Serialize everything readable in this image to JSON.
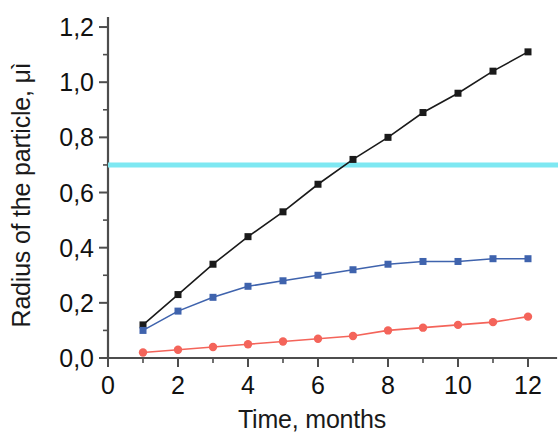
{
  "chart_data": {
    "type": "line",
    "title": "",
    "subtitle": "",
    "xlabel": "Time, months",
    "ylabel": "Radius of the particle, μì",
    "x": [
      1,
      2,
      3,
      4,
      5,
      6,
      7,
      8,
      9,
      10,
      11,
      12
    ],
    "xlim": [
      0,
      12.6
    ],
    "ylim": [
      0.0,
      1.28
    ],
    "xticks": [
      0,
      2,
      4,
      6,
      8,
      10,
      12
    ],
    "xtick_labels": [
      "0",
      "2",
      "4",
      "6",
      "8",
      "10",
      "12"
    ],
    "xminor_ticks": [
      1,
      3,
      5,
      7,
      9,
      11
    ],
    "yticks": [
      0.0,
      0.2,
      0.4,
      0.6,
      0.8,
      1.0,
      1.2
    ],
    "ytick_labels": [
      "0,0",
      "0,2",
      "0,4",
      "0,6",
      "0,8",
      "1,0",
      "1,2"
    ],
    "yminor_ticks": [
      0.1,
      0.3,
      0.5,
      0.7,
      0.9,
      1.1
    ],
    "grid": false,
    "legend": "none",
    "series": [
      {
        "name": "black-series",
        "color": "#1a1a1a",
        "marker": "square",
        "values": [
          0.12,
          0.23,
          0.34,
          0.44,
          0.53,
          0.63,
          0.72,
          0.8,
          0.89,
          0.96,
          1.04,
          1.11
        ]
      },
      {
        "name": "blue-series",
        "color": "#3f63ad",
        "marker": "square",
        "values": [
          0.1,
          0.17,
          0.22,
          0.26,
          0.28,
          0.3,
          0.32,
          0.34,
          0.35,
          0.35,
          0.36,
          0.36
        ]
      },
      {
        "name": "red-series",
        "color": "#f4645a",
        "marker": "circle",
        "values": [
          0.02,
          0.03,
          0.04,
          0.05,
          0.06,
          0.07,
          0.08,
          0.1,
          0.11,
          0.12,
          0.13,
          0.15
        ]
      }
    ],
    "annotations": [
      {
        "name": "threshold-line",
        "type": "hline",
        "value": 0.7,
        "color": "#7ee8f2"
      }
    ]
  }
}
